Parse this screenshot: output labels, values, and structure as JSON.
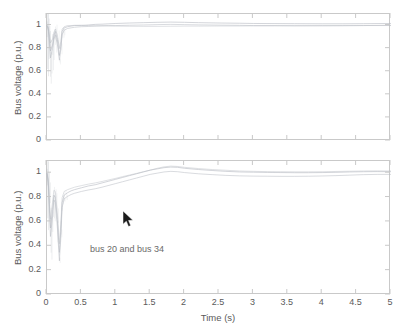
{
  "figure": {
    "background": "#ffffff",
    "axis_color": "#c9c9c9",
    "text_color": "#5a5a5a",
    "trace_color": "#b9bdc4"
  },
  "panels": [
    {
      "id": "top",
      "ylabel": "Bus voltage (p.u.)",
      "xlabel": "",
      "yticks": [
        "0",
        "0.2",
        "0.4",
        "0.6",
        "0.8",
        "1"
      ],
      "xticks": [
        "",
        "",
        "",
        "",
        "",
        "",
        "",
        "",
        "",
        "",
        ""
      ],
      "annotation": ""
    },
    {
      "id": "bottom",
      "ylabel": "Bus voltage (p.u.)",
      "xlabel": "Time (s)",
      "yticks": [
        "0",
        "0.2",
        "0.4",
        "0.6",
        "0.8",
        "1"
      ],
      "xticks": [
        "0",
        "0.5",
        "1",
        "1.5",
        "2",
        "2.5",
        "3",
        "3.5",
        "4",
        "4.5",
        "5"
      ],
      "annotation": "bus 20 and bus 34"
    }
  ],
  "cursor": {
    "name": "mouse-pointer",
    "x": 123,
    "y": 211
  },
  "chart_data": [
    {
      "type": "line",
      "title": "",
      "xlabel": "",
      "ylabel": "Bus voltage (p.u.)",
      "xlim": [
        0,
        5
      ],
      "ylim": [
        0,
        1.1
      ],
      "xticks": [
        0,
        0.5,
        1,
        1.5,
        2,
        2.5,
        3,
        3.5,
        4,
        4.5,
        5
      ],
      "yticks": [
        0,
        0.2,
        0.4,
        0.6,
        0.8,
        1
      ],
      "grid": false,
      "legend": "none",
      "x": [
        0,
        0.02,
        0.05,
        0.08,
        0.1,
        0.12,
        0.15,
        0.18,
        0.2,
        0.22,
        0.25,
        0.3,
        0.35,
        0.4,
        0.5,
        0.6,
        0.7,
        0.8,
        0.9,
        1.0,
        1.2,
        1.4,
        1.6,
        1.8,
        2.0,
        2.2,
        2.5,
        2.8,
        3.0,
        3.3,
        3.6,
        4.0,
        4.3,
        4.6,
        5.0
      ],
      "series": [
        {
          "name": "bus-a",
          "values": [
            1.0,
            0.97,
            0.78,
            0.83,
            0.91,
            0.95,
            0.88,
            0.74,
            0.82,
            0.95,
            0.98,
            0.99,
            0.995,
            1.0,
            1.0,
            1.005,
            1.01,
            1.012,
            1.015,
            1.018,
            1.022,
            1.025,
            1.028,
            1.03,
            1.028,
            1.025,
            1.022,
            1.02,
            1.018,
            1.017,
            1.016,
            1.015,
            1.015,
            1.016,
            1.018
          ]
        },
        {
          "name": "bus-b",
          "values": [
            1.0,
            0.95,
            0.72,
            0.8,
            0.88,
            0.92,
            0.84,
            0.7,
            0.79,
            0.92,
            0.96,
            0.975,
            0.98,
            0.985,
            0.99,
            0.992,
            0.995,
            0.998,
            1.0,
            1.0,
            1.003,
            1.005,
            1.008,
            1.01,
            1.008,
            1.006,
            1.004,
            1.002,
            1.0,
            1.0,
            0.998,
            0.998,
            0.999,
            1.0,
            1.002
          ]
        },
        {
          "name": "bus-c",
          "values": [
            1.0,
            0.99,
            0.85,
            0.88,
            0.94,
            0.97,
            0.92,
            0.8,
            0.86,
            0.97,
            0.99,
            1.0,
            1.0,
            1.002,
            1.003,
            1.0,
            0.998,
            0.997,
            0.996,
            0.995,
            0.994,
            0.993,
            0.993,
            0.994,
            0.995,
            0.995,
            0.996,
            0.996,
            0.997,
            0.997,
            0.998,
            0.999,
            0.999,
            1.0,
            1.0
          ]
        }
      ]
    },
    {
      "type": "line",
      "title": "",
      "xlabel": "Time (s)",
      "ylabel": "Bus voltage (p.u.)",
      "xlim": [
        0,
        5
      ],
      "ylim": [
        0,
        1.1
      ],
      "xticks": [
        0,
        0.5,
        1,
        1.5,
        2,
        2.5,
        3,
        3.5,
        4,
        4.5,
        5
      ],
      "yticks": [
        0,
        0.2,
        0.4,
        0.6,
        0.8,
        1
      ],
      "grid": false,
      "legend": "none",
      "annotation": "bus 20 and bus 34",
      "x": [
        0,
        0.02,
        0.05,
        0.08,
        0.1,
        0.12,
        0.15,
        0.18,
        0.2,
        0.22,
        0.25,
        0.3,
        0.35,
        0.4,
        0.5,
        0.6,
        0.7,
        0.8,
        0.9,
        1.0,
        1.1,
        1.2,
        1.3,
        1.4,
        1.5,
        1.6,
        1.7,
        1.8,
        1.9,
        2.0,
        2.2,
        2.4,
        2.6,
        2.8,
        3.0,
        3.2,
        3.4,
        3.6,
        3.8,
        4.0,
        4.2,
        4.4,
        4.6,
        4.8,
        5.0
      ],
      "series": [
        {
          "name": "bus 20",
          "values": [
            1.0,
            0.92,
            0.55,
            0.7,
            0.82,
            0.8,
            0.62,
            0.35,
            0.52,
            0.76,
            0.82,
            0.84,
            0.855,
            0.865,
            0.88,
            0.895,
            0.905,
            0.92,
            0.935,
            0.95,
            0.965,
            0.98,
            0.995,
            1.01,
            1.025,
            1.035,
            1.045,
            1.05,
            1.048,
            1.04,
            1.03,
            1.022,
            1.015,
            1.01,
            1.008,
            1.006,
            1.005,
            1.004,
            1.004,
            1.005,
            1.007,
            1.01,
            1.012,
            1.013,
            1.012
          ]
        },
        {
          "name": "bus 34",
          "values": [
            1.0,
            0.88,
            0.48,
            0.64,
            0.78,
            0.76,
            0.56,
            0.28,
            0.46,
            0.72,
            0.79,
            0.81,
            0.825,
            0.835,
            0.85,
            0.862,
            0.872,
            0.885,
            0.9,
            0.915,
            0.93,
            0.945,
            0.96,
            0.975,
            0.99,
            1.0,
            1.01,
            1.015,
            1.012,
            1.005,
            0.995,
            0.988,
            0.982,
            0.978,
            0.976,
            0.975,
            0.974,
            0.974,
            0.975,
            0.977,
            0.98,
            0.984,
            0.988,
            0.99,
            0.99
          ]
        },
        {
          "name": "bus-aux",
          "values": [
            1.0,
            0.95,
            0.62,
            0.76,
            0.86,
            0.85,
            0.68,
            0.42,
            0.58,
            0.8,
            0.85,
            0.865,
            0.875,
            0.885,
            0.898,
            0.91,
            0.92,
            0.932,
            0.945,
            0.958,
            0.972,
            0.985,
            0.998,
            1.012,
            1.025,
            1.04,
            1.052,
            1.058,
            1.055,
            1.048,
            1.038,
            1.03,
            1.024,
            1.018,
            1.015,
            1.013,
            1.012,
            1.011,
            1.011,
            1.012,
            1.014,
            1.016,
            1.018,
            1.019,
            1.018
          ]
        }
      ]
    }
  ]
}
